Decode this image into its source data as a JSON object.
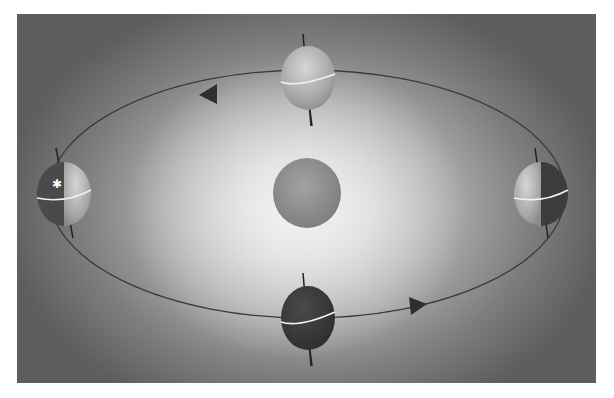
{
  "diagram": {
    "type": "earth-orbit-seasons",
    "colors": {
      "background_edge": "#5e5e5e",
      "background_center": "#e4e4e4",
      "sun": "#8f8f8f",
      "orbit": "#3a3a3a",
      "equator": "#f2f2f2",
      "axis": "#222222",
      "lit_side": "#bdbdbd",
      "dark_side": "#3c3c3c"
    },
    "sun": {
      "label": "",
      "cx": 290,
      "cy": 179,
      "rx": 34,
      "ry": 35
    },
    "orbit": {
      "cx": 290,
      "cy": 180,
      "rx": 258,
      "ry": 124,
      "direction": "counter-clockwise"
    },
    "arrows": [
      {
        "name": "orbit-arrow-top",
        "x": 193,
        "y": 80,
        "direction": "left"
      },
      {
        "name": "orbit-arrow-bottom",
        "x": 394,
        "y": 292,
        "direction": "right"
      }
    ],
    "earths": [
      {
        "name": "earth-top",
        "position": "top",
        "cx": 291,
        "cy": 64,
        "lighting": "full-lit"
      },
      {
        "name": "earth-left",
        "position": "left",
        "cx": 47,
        "cy": 180,
        "lighting": "half-lit-right",
        "marker": "star"
      },
      {
        "name": "earth-right",
        "position": "right",
        "cx": 524,
        "cy": 180,
        "lighting": "half-lit-left"
      },
      {
        "name": "earth-bottom",
        "position": "bottom",
        "cx": 291,
        "cy": 304,
        "lighting": "dark"
      }
    ]
  }
}
